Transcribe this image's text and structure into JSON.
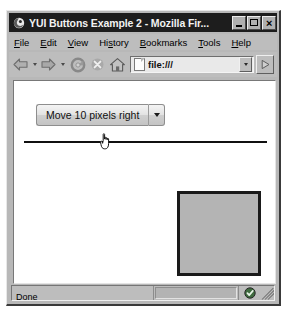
{
  "window": {
    "title": "YUI Buttons Example 2 - Mozilla Fir...",
    "logo_icon": "firefox-logo-icon",
    "controls": {
      "minimize_label": "_",
      "maximize_label": "□",
      "close_label": "×"
    }
  },
  "menubar": {
    "items": [
      {
        "label": "File",
        "accel": "F"
      },
      {
        "label": "Edit",
        "accel": "E"
      },
      {
        "label": "View",
        "accel": "V"
      },
      {
        "label": "History",
        "accel": "s"
      },
      {
        "label": "Bookmarks",
        "accel": "B"
      },
      {
        "label": "Tools",
        "accel": "T"
      },
      {
        "label": "Help",
        "accel": "H"
      }
    ]
  },
  "toolbar": {
    "back_icon": "back-arrow-icon",
    "back_dropdown_icon": "chevron-down-icon",
    "forward_icon": "forward-arrow-icon",
    "forward_dropdown_icon": "chevron-down-icon",
    "reload_icon": "reload-icon",
    "stop_icon": "stop-icon",
    "home_icon": "home-icon",
    "urlbar": {
      "page_icon": "page-document-icon",
      "value": "file:///",
      "dropdown_icon": "chevron-down-icon"
    },
    "go_icon": "go-arrow-icon"
  },
  "page": {
    "split_button": {
      "label": "Move 10 pixels right",
      "menu_arrow_icon": "chevron-down-icon"
    },
    "divider": "horizontal-rule",
    "box": {
      "name": "moveable-box",
      "fill_color": "#b4b4b4",
      "border_color": "#1a1a1a"
    },
    "cursor_icon": "pointing-hand-cursor"
  },
  "statusbar": {
    "status_text": "Done",
    "progress_value": "",
    "security_icon": "security-shield-check-icon",
    "resize_grip_icon": "resize-grip-icon"
  },
  "colors": {
    "chrome": "#bdbdbd",
    "titlebar": "#1d1d1d",
    "content": "#ffffff",
    "box_fill": "#b4b4b4"
  }
}
